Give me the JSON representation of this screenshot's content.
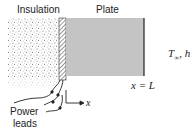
{
  "diagram": {
    "labels": {
      "insulation": "Insulation",
      "plate": "Plate",
      "ambient": "T",
      "ambient_sub": "∞",
      "ambient_rest": ", h",
      "boundary": "x = L",
      "axis": "x",
      "power_leads_line1": "Power",
      "power_leads_line2": "leads"
    },
    "colors": {
      "plate_fill": "#c4c4c4",
      "insulation_dots": "#555555",
      "line": "#222222"
    }
  }
}
